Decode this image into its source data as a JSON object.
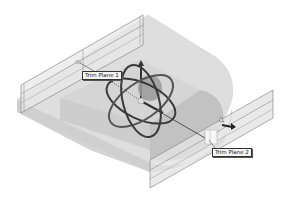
{
  "figure": {
    "labels": {
      "trim_plane_1": "Trim Plane 1",
      "trim_plane_2": "Trim Plane 2"
    },
    "colors": {
      "background": "#ffffff",
      "body_top": "#dcdcdc",
      "body_side": "#c4c4c4",
      "body_curve": "#b4b4b4",
      "plane_fill": "#e6e6e6",
      "plane_edge": "#8a8a8a",
      "gizmo_ring": "#3a3a3a",
      "gizmo_ring_light": "#6a6a6a",
      "axis_line": "#333333"
    },
    "gizmo": {
      "center": [
        141,
        101
      ],
      "ring_count": 3
    }
  }
}
